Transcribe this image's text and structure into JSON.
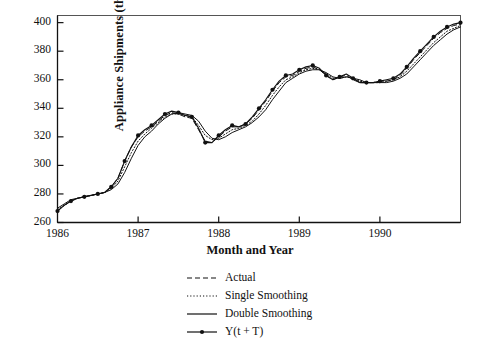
{
  "chart_data": {
    "type": "line",
    "title": "",
    "xlabel": "Month and Year",
    "ylabel": "Appliance Shipments (thousands)",
    "xlim": [
      1986.0,
      1991.0
    ],
    "ylim": [
      260,
      405
    ],
    "yticks": [
      260,
      280,
      300,
      320,
      340,
      360,
      380,
      400
    ],
    "xticks": [
      1986,
      1987,
      1988,
      1989,
      1990
    ],
    "xtick_labels": [
      "1986",
      "1987",
      "1988",
      "1989",
      "1990"
    ],
    "ytick_labels": [
      "260",
      "280",
      "300",
      "320",
      "340",
      "360",
      "380",
      "400"
    ],
    "grid": false,
    "legend_position": "below-center",
    "x": [
      1986.0,
      1986.083,
      1986.167,
      1986.25,
      1986.333,
      1986.417,
      1986.5,
      1986.583,
      1986.667,
      1986.75,
      1986.833,
      1986.917,
      1987.0,
      1987.083,
      1987.167,
      1987.25,
      1987.333,
      1987.417,
      1987.5,
      1987.583,
      1987.667,
      1987.75,
      1987.833,
      1987.917,
      1988.0,
      1988.083,
      1988.167,
      1988.25,
      1988.333,
      1988.417,
      1988.5,
      1988.583,
      1988.667,
      1988.75,
      1988.833,
      1988.917,
      1989.0,
      1989.083,
      1989.167,
      1989.25,
      1989.333,
      1989.417,
      1989.5,
      1989.583,
      1989.667,
      1989.75,
      1989.833,
      1989.917,
      1990.0,
      1990.083,
      1990.167,
      1990.25,
      1990.333,
      1990.417,
      1990.5,
      1990.583,
      1990.667,
      1990.75,
      1990.833,
      1990.917,
      1991.0
    ],
    "series": [
      {
        "name": "Actual",
        "style": "dashed",
        "values": [
          268,
          272,
          275,
          277,
          278,
          279,
          280,
          281,
          285,
          291,
          303,
          313,
          320,
          324,
          327,
          331,
          335,
          337,
          336,
          334,
          333,
          325,
          317,
          316,
          320,
          324,
          327,
          327,
          329,
          333,
          339,
          345,
          352,
          358,
          362,
          363,
          366,
          368,
          369,
          367,
          363,
          360,
          362,
          363,
          360,
          358,
          358,
          358,
          359,
          359,
          360,
          363,
          368,
          374,
          379,
          384,
          389,
          393,
          396,
          398,
          399
        ]
      },
      {
        "name": "Single Smoothing",
        "style": "dotted",
        "values": [
          269,
          272,
          275,
          277,
          278,
          279,
          280,
          281,
          284,
          289,
          299,
          309,
          317,
          322,
          326,
          330,
          334,
          336,
          336,
          335,
          334,
          328,
          321,
          318,
          319,
          322,
          325,
          326,
          328,
          331,
          336,
          342,
          349,
          355,
          360,
          362,
          365,
          367,
          368,
          367,
          364,
          361,
          361,
          362,
          361,
          359,
          358,
          358,
          358,
          359,
          360,
          362,
          366,
          371,
          376,
          381,
          386,
          390,
          394,
          396,
          398
        ]
      },
      {
        "name": "Double Smoothing",
        "style": "solid",
        "values": [
          270,
          273,
          276,
          277,
          278,
          279,
          280,
          281,
          283,
          287,
          295,
          305,
          314,
          320,
          324,
          329,
          333,
          336,
          337,
          336,
          335,
          331,
          324,
          319,
          318,
          320,
          323,
          325,
          327,
          330,
          334,
          339,
          346,
          352,
          358,
          361,
          364,
          366,
          367,
          367,
          365,
          362,
          361,
          362,
          361,
          360,
          358,
          358,
          358,
          358,
          359,
          361,
          364,
          369,
          374,
          379,
          384,
          388,
          392,
          395,
          397
        ]
      },
      {
        "name": "Y(t + T)",
        "style": "solid-markers",
        "values": [
          268,
          272,
          275,
          277,
          278,
          279,
          280,
          281,
          285,
          291,
          303,
          313,
          321,
          325,
          328,
          332,
          336,
          338,
          337,
          335,
          334,
          326,
          316,
          316,
          321,
          325,
          328,
          327,
          329,
          334,
          340,
          346,
          353,
          359,
          363,
          364,
          367,
          369,
          370,
          368,
          363,
          360,
          362,
          364,
          361,
          358,
          358,
          358,
          359,
          360,
          361,
          364,
          369,
          375,
          380,
          385,
          390,
          394,
          397,
          399,
          400
        ]
      }
    ]
  },
  "legend": {
    "items": [
      {
        "label": "Actual",
        "style": "dashed"
      },
      {
        "label": "Single Smoothing",
        "style": "dotted"
      },
      {
        "label": "Double Smoothing",
        "style": "solid"
      },
      {
        "label": "Y(t + T)",
        "style": "solid-markers"
      }
    ]
  }
}
